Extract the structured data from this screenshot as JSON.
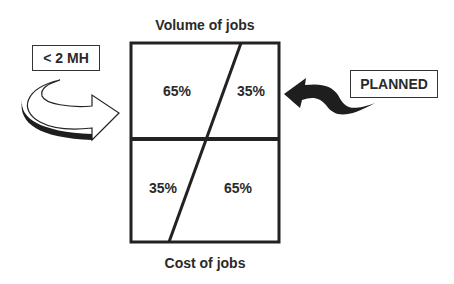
{
  "diagram": {
    "top_title": "Volume of jobs",
    "bottom_title": "Cost of jobs",
    "left_label": "< 2 MH",
    "right_label": "PLANNED",
    "top_row": {
      "left_pct": "65%",
      "right_pct": "35%"
    },
    "bottom_row": {
      "left_pct": "35%",
      "right_pct": "65%"
    },
    "icons": [
      "curved-arrow-right-icon",
      "curved-arrow-left-icon"
    ]
  }
}
